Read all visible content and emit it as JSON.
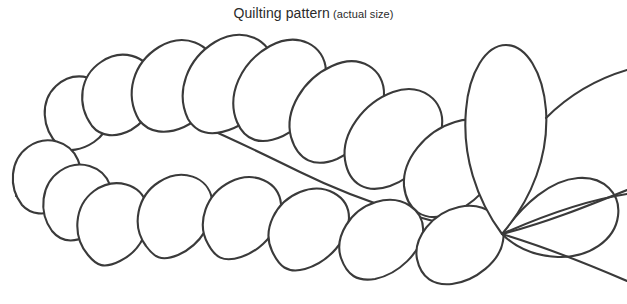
{
  "document": {
    "background_color": "#ffffff",
    "width": 627,
    "height": 304
  },
  "caption": {
    "title": "Quilting pattern",
    "note": "(actual size)"
  },
  "artwork": {
    "name": "feather-plume-quilting-motif",
    "description": "Line-art feather plume made of overlapping teardrop petals arranged along a curving spine, converging at a single point on the right side, with one large upright central petal.",
    "line_color": "#3a3a3a",
    "fill_color": "#ffffff",
    "stroke_width": 2.1,
    "convergence_point": {
      "x": 502,
      "y": 234
    },
    "upper_petals": [
      {
        "id": "u1",
        "path": "M 59 146 C 41 128 40 101 56 86 C 72 71 96 74 107 92 C 117 108 110 131 94 142 C 82 150 68 153 59 146 Z"
      },
      {
        "id": "u2",
        "path": "M 92 126 C 76 104 80 76 101 62 C 121 48 146 55 154 76 C 161 95 150 119 131 130 C 116 138 101 137 92 126 Z"
      },
      {
        "id": "u3",
        "path": "M 139 120 C 124 94 133 63 159 47 C 184 32 211 43 216 68 C 221 91 206 117 184 127 C 166 135 149 133 139 120 Z"
      },
      {
        "id": "u4",
        "path": "M 188 119 C 175 92 187 59 215 42 C 243 26 271 39 274 65 C 277 89 259 117 234 128 C 213 137 197 134 188 119 Z"
      },
      {
        "id": "u5",
        "path": "M 237 122 C 226 95 241 62 270 46 C 298 31 325 45 326 71 C 327 95 308 124 283 136 C 261 146 245 141 237 122 Z"
      },
      {
        "id": "u6",
        "path": "M 291 137 C 284 111 303 79 332 66 C 360 53 385 69 384 95 C 383 119 362 148 337 159 C 315 168 298 161 291 137 Z"
      },
      {
        "id": "u7",
        "path": "M 345 160 C 341 134 363 103 393 92 C 421 82 445 100 442 126 C 439 150 415 177 390 186 C 367 194 349 185 345 160 Z"
      },
      {
        "id": "u8",
        "path": "M 404 186 C 402 160 425 131 455 122 C 483 113 505 133 501 159 C 497 182 472 207 447 215 C 424 222 407 211 404 186 Z"
      }
    ],
    "lower_petals": [
      {
        "id": "l1",
        "path": "M 22 205 C 8 187 10 160 28 147 C 46 134 70 141 78 160 C 86 178 76 200 58 209 C 45 216 31 215 22 205 Z"
      },
      {
        "id": "l2",
        "path": "M 52 231 C 38 212 41 184 60 171 C 79 158 103 166 110 185 C 117 204 106 227 87 236 C 73 243 61 242 52 231 Z"
      },
      {
        "id": "l3",
        "path": "M 88 255 C 72 236 74 206 94 191 C 115 176 141 184 147 205 C 153 226 141 251 120 261 C 104 269 97 266 88 255 Z"
      },
      {
        "id": "l4",
        "path": "M 146 246 C 131 226 137 196 159 182 C 182 167 208 177 212 199 C 216 220 201 245 178 255 C 161 262 154 257 146 246 Z"
      },
      {
        "id": "l5",
        "path": "M 208 244 C 196 223 206 194 230 182 C 254 170 279 182 281 204 C 283 225 265 249 241 257 C 223 263 215 257 208 244 Z"
      },
      {
        "id": "l6",
        "path": "M 272 251 C 262 230 275 202 300 192 C 325 182 349 196 349 218 C 349 239 329 262 305 269 C 287 274 279 266 272 251 Z"
      },
      {
        "id": "l7",
        "path": "M 341 258 C 334 237 350 210 376 202 C 402 194 425 210 423 232 C 421 252 399 274 375 279 C 357 282 347 275 341 258 Z"
      },
      {
        "id": "l8",
        "path": "M 417 259 C 413 238 432 213 459 207 C 486 201 507 219 503 241 C 500 261 476 281 452 284 C 434 286 421 278 417 259 Z"
      }
    ],
    "center_petal": {
      "id": "center",
      "path": "M 502 234 C 476 199 462 155 466 110 C 469 72 486 45 506 45 C 526 45 543 72 546 110 C 549 155 532 199 502 234 Z"
    },
    "right_petal": {
      "id": "right",
      "path": "M 502 234 C 524 203 551 180 578 178 C 604 176 621 194 618 216 C 615 240 589 258 558 257 C 535 256 516 248 502 234 Z"
    },
    "spine_curves": [
      {
        "id": "spine-main",
        "path": "M 96 88 C 160 104 235 140 300 172 C 365 204 445 228 502 234"
      },
      {
        "id": "spine-lower",
        "path": "M 16 196 C 90 206 180 214 270 220 C 350 226 440 231 502 234"
      },
      {
        "id": "tail-upper",
        "path": "M 502 234 C 545 223 585 207 627 190"
      },
      {
        "id": "tail-lower",
        "path": "M 502 234 C 548 248 590 265 627 281"
      },
      {
        "id": "tail-top",
        "path": "M 546 118 C 572 92 600 78 627 70"
      },
      {
        "id": "tail-edge",
        "path": "M 502 234 C 547 214 588 200 627 194"
      }
    ]
  }
}
